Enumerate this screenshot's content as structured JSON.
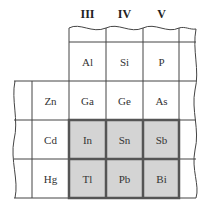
{
  "headers": [
    "III",
    "IV",
    "V"
  ],
  "rows": [
    {
      "label": "",
      "cells": [
        "Al",
        "Si",
        "P"
      ]
    },
    {
      "label": "Zn",
      "cells": [
        "Ga",
        "Ge",
        "As"
      ]
    },
    {
      "label": "Cd",
      "cells": [
        "In",
        "Sn",
        "Sb"
      ],
      "highlighted": true
    },
    {
      "label": "Hg",
      "cells": [
        "Tl",
        "Pb",
        "Bi"
      ],
      "highlighted": true
    }
  ],
  "colors": {
    "highlight_fill": "#d4d4d4",
    "highlight_border": "#555555",
    "line": "#444444"
  }
}
